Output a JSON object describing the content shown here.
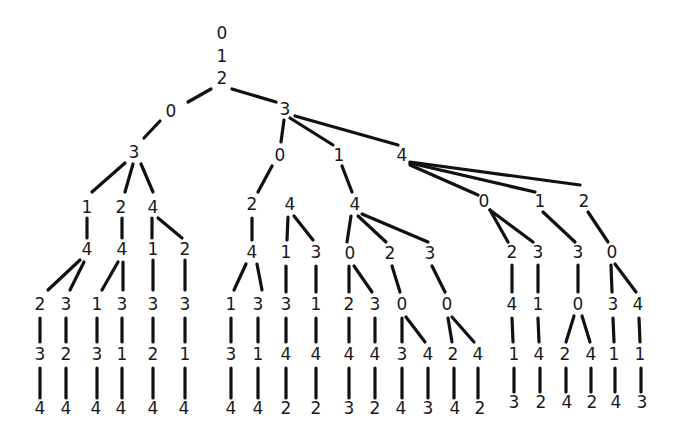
{
  "diagram": {
    "type": "tree",
    "colors": {
      "edge": "#111111",
      "label": "#1a1a1a",
      "background": "#ffffff"
    },
    "nodes": [
      {
        "id": "n0",
        "label": "0",
        "x": 222,
        "y": 34
      },
      {
        "id": "n1",
        "label": "1",
        "x": 222,
        "y": 57
      },
      {
        "id": "n2",
        "label": "2",
        "x": 222,
        "y": 79
      },
      {
        "id": "a0",
        "label": "0",
        "x": 171,
        "y": 112
      },
      {
        "id": "a3",
        "label": "3",
        "x": 134,
        "y": 153
      },
      {
        "id": "a31",
        "label": "1",
        "x": 87,
        "y": 208
      },
      {
        "id": "a32",
        "label": "2",
        "x": 121,
        "y": 208
      },
      {
        "id": "a34",
        "label": "4",
        "x": 153,
        "y": 208
      },
      {
        "id": "a314",
        "label": "4",
        "x": 87,
        "y": 250
      },
      {
        "id": "a324",
        "label": "4",
        "x": 122,
        "y": 250
      },
      {
        "id": "a341",
        "label": "1",
        "x": 153,
        "y": 250
      },
      {
        "id": "a342",
        "label": "2",
        "x": 185,
        "y": 250
      },
      {
        "id": "l1",
        "label": "2",
        "x": 40,
        "y": 305
      },
      {
        "id": "l2",
        "label": "3",
        "x": 66,
        "y": 305
      },
      {
        "id": "l3",
        "label": "1",
        "x": 97,
        "y": 305
      },
      {
        "id": "l4",
        "label": "3",
        "x": 122,
        "y": 305
      },
      {
        "id": "l5",
        "label": "3",
        "x": 153,
        "y": 305
      },
      {
        "id": "l6",
        "label": "3",
        "x": 185,
        "y": 305
      },
      {
        "id": "l1b",
        "label": "3",
        "x": 40,
        "y": 355
      },
      {
        "id": "l2b",
        "label": "2",
        "x": 66,
        "y": 355
      },
      {
        "id": "l3b",
        "label": "3",
        "x": 97,
        "y": 355
      },
      {
        "id": "l4b",
        "label": "1",
        "x": 122,
        "y": 355
      },
      {
        "id": "l5b",
        "label": "2",
        "x": 153,
        "y": 355
      },
      {
        "id": "l6b",
        "label": "1",
        "x": 185,
        "y": 355
      },
      {
        "id": "l1c",
        "label": "4",
        "x": 40,
        "y": 409
      },
      {
        "id": "l2c",
        "label": "4",
        "x": 66,
        "y": 409
      },
      {
        "id": "l3c",
        "label": "4",
        "x": 96,
        "y": 409
      },
      {
        "id": "l4c",
        "label": "4",
        "x": 121,
        "y": 409
      },
      {
        "id": "l5c",
        "label": "4",
        "x": 153,
        "y": 409
      },
      {
        "id": "l6c",
        "label": "4",
        "x": 184,
        "y": 409
      },
      {
        "id": "b3",
        "label": "3",
        "x": 285,
        "y": 110
      },
      {
        "id": "b0",
        "label": "0",
        "x": 280,
        "y": 156
      },
      {
        "id": "b1",
        "label": "1",
        "x": 339,
        "y": 156
      },
      {
        "id": "b4",
        "label": "4",
        "x": 402,
        "y": 156
      },
      {
        "id": "b02",
        "label": "2",
        "x": 252,
        "y": 205
      },
      {
        "id": "b024",
        "label": "4",
        "x": 252,
        "y": 253
      },
      {
        "id": "b0241",
        "label": "1",
        "x": 231,
        "y": 305
      },
      {
        "id": "b0243",
        "label": "3",
        "x": 258,
        "y": 305
      },
      {
        "id": "b02413",
        "label": "3",
        "x": 231,
        "y": 355
      },
      {
        "id": "b02431",
        "label": "1",
        "x": 258,
        "y": 355
      },
      {
        "id": "b024134",
        "label": "4",
        "x": 231,
        "y": 409
      },
      {
        "id": "b024314",
        "label": "4",
        "x": 258,
        "y": 409
      },
      {
        "id": "c4",
        "label": "4",
        "x": 290,
        "y": 205
      },
      {
        "id": "c41",
        "label": "1",
        "x": 286,
        "y": 253
      },
      {
        "id": "c43",
        "label": "3",
        "x": 316,
        "y": 253
      },
      {
        "id": "c413",
        "label": "3",
        "x": 286,
        "y": 305
      },
      {
        "id": "c431",
        "label": "1",
        "x": 316,
        "y": 305
      },
      {
        "id": "c4134",
        "label": "4",
        "x": 286,
        "y": 355
      },
      {
        "id": "c4314",
        "label": "4",
        "x": 316,
        "y": 355
      },
      {
        "id": "c41342",
        "label": "2",
        "x": 286,
        "y": 409
      },
      {
        "id": "c43142",
        "label": "2",
        "x": 316,
        "y": 409
      },
      {
        "id": "b14",
        "label": "4",
        "x": 355,
        "y": 205
      },
      {
        "id": "b140",
        "label": "0",
        "x": 350,
        "y": 254
      },
      {
        "id": "b142",
        "label": "2",
        "x": 390,
        "y": 254
      },
      {
        "id": "b143",
        "label": "3",
        "x": 430,
        "y": 254
      },
      {
        "id": "b1402",
        "label": "2",
        "x": 349,
        "y": 305
      },
      {
        "id": "b1403",
        "label": "3",
        "x": 375,
        "y": 305
      },
      {
        "id": "b1420",
        "label": "0",
        "x": 402,
        "y": 305
      },
      {
        "id": "b1430",
        "label": "0",
        "x": 447,
        "y": 305
      },
      {
        "id": "b14024",
        "label": "4",
        "x": 349,
        "y": 355
      },
      {
        "id": "b14034",
        "label": "4",
        "x": 375,
        "y": 355
      },
      {
        "id": "b14203",
        "label": "3",
        "x": 402,
        "y": 355
      },
      {
        "id": "b14204",
        "label": "4",
        "x": 428,
        "y": 355
      },
      {
        "id": "b14302",
        "label": "2",
        "x": 453,
        "y": 355
      },
      {
        "id": "b14304",
        "label": "4",
        "x": 478,
        "y": 355
      },
      {
        "id": "b140243",
        "label": "3",
        "x": 349,
        "y": 409
      },
      {
        "id": "b140342",
        "label": "2",
        "x": 375,
        "y": 409
      },
      {
        "id": "b142034",
        "label": "4",
        "x": 401,
        "y": 409
      },
      {
        "id": "b142043",
        "label": "3",
        "x": 428,
        "y": 409
      },
      {
        "id": "b143024",
        "label": "4",
        "x": 455,
        "y": 409
      },
      {
        "id": "b143042",
        "label": "2",
        "x": 480,
        "y": 409
      },
      {
        "id": "b40",
        "label": "0",
        "x": 484,
        "y": 202
      },
      {
        "id": "b41",
        "label": "1",
        "x": 540,
        "y": 202
      },
      {
        "id": "b42",
        "label": "2",
        "x": 584,
        "y": 202
      },
      {
        "id": "b402",
        "label": "2",
        "x": 512,
        "y": 253
      },
      {
        "id": "b403",
        "label": "3",
        "x": 538,
        "y": 253
      },
      {
        "id": "b413",
        "label": "3",
        "x": 578,
        "y": 253
      },
      {
        "id": "b420",
        "label": "0",
        "x": 612,
        "y": 253
      },
      {
        "id": "b4024",
        "label": "4",
        "x": 512,
        "y": 305
      },
      {
        "id": "b4031",
        "label": "1",
        "x": 538,
        "y": 305
      },
      {
        "id": "b4130",
        "label": "0",
        "x": 578,
        "y": 305
      },
      {
        "id": "b4203",
        "label": "3",
        "x": 613,
        "y": 305
      },
      {
        "id": "b4204",
        "label": "4",
        "x": 638,
        "y": 305
      },
      {
        "id": "b40241",
        "label": "1",
        "x": 514,
        "y": 355
      },
      {
        "id": "b40314",
        "label": "4",
        "x": 539,
        "y": 355
      },
      {
        "id": "b41302",
        "label": "2",
        "x": 565,
        "y": 355
      },
      {
        "id": "b41304",
        "label": "4",
        "x": 591,
        "y": 355
      },
      {
        "id": "b42031",
        "label": "1",
        "x": 614,
        "y": 355
      },
      {
        "id": "b42041",
        "label": "1",
        "x": 640,
        "y": 355
      },
      {
        "id": "b402413",
        "label": "3",
        "x": 514,
        "y": 403
      },
      {
        "id": "b403142",
        "label": "2",
        "x": 541,
        "y": 403
      },
      {
        "id": "b413024",
        "label": "4",
        "x": 567,
        "y": 403
      },
      {
        "id": "b413042",
        "label": "2",
        "x": 592,
        "y": 403
      },
      {
        "id": "b420314",
        "label": "4",
        "x": 616,
        "y": 403
      },
      {
        "id": "b420413",
        "label": "3",
        "x": 642,
        "y": 403
      }
    ],
    "edges": [
      [
        211,
        89,
        188,
        102
      ],
      [
        160,
        121,
        144,
        138
      ],
      [
        232,
        89,
        276,
        102
      ],
      [
        125,
        163,
        92,
        192
      ],
      [
        133,
        164,
        125,
        192
      ],
      [
        141,
        164,
        153,
        192
      ],
      [
        87,
        218,
        87,
        238
      ],
      [
        122,
        218,
        122,
        238
      ],
      [
        152,
        218,
        152,
        238
      ],
      [
        158,
        218,
        182,
        238
      ],
      [
        80,
        260,
        48,
        290
      ],
      [
        84,
        262,
        70,
        290
      ],
      [
        118,
        262,
        102,
        290
      ],
      [
        123,
        262,
        123,
        290
      ],
      [
        153,
        260,
        153,
        290
      ],
      [
        185,
        260,
        185,
        290
      ],
      [
        40,
        318,
        40,
        342
      ],
      [
        66,
        318,
        66,
        342
      ],
      [
        97,
        318,
        97,
        342
      ],
      [
        122,
        318,
        122,
        342
      ],
      [
        153,
        318,
        153,
        342
      ],
      [
        185,
        318,
        185,
        342
      ],
      [
        40,
        368,
        40,
        398
      ],
      [
        66,
        368,
        66,
        398
      ],
      [
        97,
        368,
        97,
        398
      ],
      [
        122,
        368,
        122,
        398
      ],
      [
        153,
        368,
        153,
        398
      ],
      [
        185,
        368,
        185,
        398
      ],
      [
        284,
        120,
        281,
        142
      ],
      [
        290,
        118,
        333,
        145
      ],
      [
        295,
        116,
        398,
        145
      ],
      [
        272,
        166,
        258,
        192
      ],
      [
        252,
        218,
        252,
        240
      ],
      [
        246,
        264,
        234,
        290
      ],
      [
        257,
        264,
        262,
        290
      ],
      [
        231,
        318,
        231,
        342
      ],
      [
        258,
        318,
        258,
        342
      ],
      [
        231,
        368,
        231,
        398
      ],
      [
        258,
        368,
        258,
        398
      ],
      [
        288,
        217,
        287,
        240
      ],
      [
        294,
        216,
        313,
        240
      ],
      [
        286,
        266,
        286,
        292
      ],
      [
        316,
        266,
        316,
        292
      ],
      [
        286,
        318,
        286,
        342
      ],
      [
        316,
        318,
        316,
        342
      ],
      [
        286,
        368,
        286,
        398
      ],
      [
        316,
        368,
        316,
        398
      ],
      [
        342,
        166,
        352,
        192
      ],
      [
        351,
        216,
        347,
        242
      ],
      [
        358,
        216,
        386,
        242
      ],
      [
        362,
        214,
        428,
        242
      ],
      [
        349,
        266,
        349,
        292
      ],
      [
        354,
        266,
        372,
        292
      ],
      [
        392,
        266,
        400,
        292
      ],
      [
        432,
        266,
        445,
        292
      ],
      [
        349,
        318,
        349,
        342
      ],
      [
        375,
        318,
        375,
        342
      ],
      [
        402,
        318,
        402,
        342
      ],
      [
        406,
        317,
        425,
        342
      ],
      [
        448,
        318,
        452,
        342
      ],
      [
        452,
        317,
        474,
        342
      ],
      [
        349,
        368,
        349,
        398
      ],
      [
        375,
        368,
        375,
        398
      ],
      [
        402,
        368,
        402,
        398
      ],
      [
        428,
        368,
        428,
        398
      ],
      [
        454,
        368,
        454,
        398
      ],
      [
        478,
        368,
        478,
        398
      ],
      [
        410,
        165,
        478,
        195
      ],
      [
        410,
        163,
        535,
        192
      ],
      [
        410,
        162,
        580,
        185
      ],
      [
        490,
        210,
        508,
        242
      ],
      [
        490,
        210,
        533,
        242
      ],
      [
        543,
        212,
        575,
        242
      ],
      [
        588,
        212,
        608,
        242
      ],
      [
        512,
        265,
        512,
        292
      ],
      [
        538,
        265,
        538,
        292
      ],
      [
        578,
        265,
        578,
        292
      ],
      [
        611,
        265,
        612,
        292
      ],
      [
        615,
        264,
        636,
        292
      ],
      [
        512,
        318,
        513,
        342
      ],
      [
        538,
        318,
        539,
        342
      ],
      [
        574,
        316,
        566,
        342
      ],
      [
        582,
        316,
        590,
        342
      ],
      [
        613,
        318,
        614,
        342
      ],
      [
        639,
        318,
        640,
        342
      ],
      [
        514,
        368,
        514,
        392
      ],
      [
        540,
        368,
        540,
        392
      ],
      [
        566,
        368,
        566,
        392
      ],
      [
        591,
        368,
        591,
        392
      ],
      [
        615,
        368,
        615,
        392
      ],
      [
        641,
        368,
        641,
        392
      ]
    ]
  }
}
